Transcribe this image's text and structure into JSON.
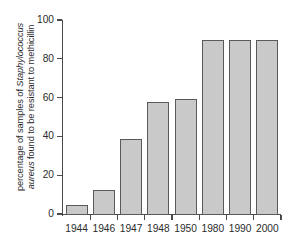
{
  "chart_data": {
    "type": "bar",
    "title": "",
    "xlabel": "",
    "ylabel_lines": [
      "percentage of samples of Staphylococcus",
      "aureus found to be resistant to methicillin"
    ],
    "ylabel_line1_plain": "percentage of samples of ",
    "ylabel_line1_italic": "Staphylococcus",
    "ylabel_line2_italic": "aureus",
    "ylabel_line2_plain": " found to be resistant to methicillin",
    "categories": [
      "1944",
      "1946",
      "1947",
      "1948",
      "1950",
      "1980",
      "1990",
      "2000"
    ],
    "values": [
      5,
      13,
      39,
      58,
      60,
      90,
      90,
      90
    ],
    "ylim": [
      0,
      100
    ],
    "ytick_labels": [
      "0",
      "20",
      "40",
      "60",
      "80",
      "100"
    ],
    "ytick_values": [
      0,
      20,
      40,
      60,
      80,
      100
    ],
    "grid": false,
    "legend": false,
    "bar_fill_color": "#c9c9c9",
    "bar_border_color": "#5a5a5a",
    "axis_color": "#4a4a4a",
    "background_color": "#ffffff"
  }
}
